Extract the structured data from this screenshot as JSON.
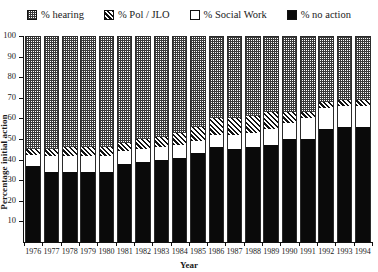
{
  "chart_data": {
    "type": "bar",
    "subtype": "stacked-bar-100",
    "title": "",
    "xlabel": "Year",
    "ylabel": "Percentage initial action",
    "ylim": [
      0,
      100
    ],
    "yticks": [
      10,
      20,
      30,
      40,
      50,
      60,
      70,
      80,
      90,
      100
    ],
    "ytick_labels": [
      "10",
      "20",
      "30",
      "40",
      "50",
      "60",
      "70",
      "80",
      "90",
      "100"
    ],
    "grid": false,
    "legend_position": "top",
    "categories": [
      "1976",
      "1977",
      "1978",
      "1979",
      "1980",
      "1981",
      "1982",
      "1983",
      "1984",
      "1985",
      "1986",
      "1987",
      "1988",
      "1989",
      "1990",
      "1991",
      "1992",
      "1993",
      "1994"
    ],
    "stack_order_bottom_to_top": [
      "% no action",
      "% Social Work",
      "% Pol / JLO",
      "% hearing"
    ],
    "series": [
      {
        "name": "% no action",
        "pattern": "solid-black",
        "color": "#0a0a0a",
        "values": [
          37,
          34,
          34,
          34,
          34,
          38,
          39,
          40,
          41,
          43,
          46,
          45,
          46,
          47,
          50,
          50,
          55,
          56,
          56
        ]
      },
      {
        "name": "% Social Work",
        "pattern": "open-white",
        "color": "#ffffff",
        "values": [
          5,
          8,
          8,
          8,
          8,
          6,
          6,
          6,
          6,
          6,
          6,
          7,
          7,
          8,
          8,
          10,
          10,
          10,
          10
        ]
      },
      {
        "name": "% Pol / JLO",
        "pattern": "diagonal-hatch",
        "color": "#121212",
        "values": [
          3,
          3,
          4,
          4,
          4,
          4,
          5,
          5,
          6,
          7,
          8,
          8,
          8,
          8,
          5,
          3,
          3,
          3,
          3
        ]
      },
      {
        "name": "% hearing",
        "pattern": "cross-hatch",
        "color": "#3a3a3a",
        "values": [
          55,
          55,
          54,
          54,
          54,
          52,
          50,
          49,
          47,
          44,
          40,
          40,
          39,
          37,
          37,
          37,
          32,
          31,
          31
        ]
      }
    ]
  },
  "legend": {
    "items": [
      {
        "label": "% hearing",
        "swatch": "pat-hearing",
        "icon": "cross-hatch-swatch-icon"
      },
      {
        "label": "% Pol / JLO",
        "swatch": "pat-pol",
        "icon": "diagonal-hatch-swatch-icon"
      },
      {
        "label": "% Social Work",
        "swatch": "pat-social",
        "icon": "open-white-swatch-icon"
      },
      {
        "label": "% no action",
        "swatch": "pat-noaction",
        "icon": "solid-black-swatch-icon"
      }
    ]
  }
}
